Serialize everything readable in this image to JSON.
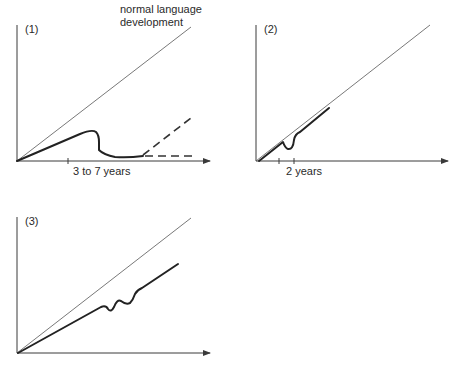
{
  "figure": {
    "panels": [
      {
        "id": "1",
        "label": "(1)",
        "annotation": [
          "normal language",
          "development"
        ],
        "x_label": "3 to 7 years",
        "series": [
          {
            "name": "normal language development",
            "style": "thin-line"
          },
          {
            "name": "development with regression",
            "style": "thick-line"
          },
          {
            "name": "possible recovery",
            "style": "dashed"
          },
          {
            "name": "possible plateau",
            "style": "dashed"
          }
        ]
      },
      {
        "id": "2",
        "label": "(2)",
        "x_label": "2 years",
        "series": [
          {
            "name": "normal language development",
            "style": "thin-line"
          },
          {
            "name": "development with brief dip",
            "style": "thick-line"
          }
        ]
      },
      {
        "id": "3",
        "label": "(3)",
        "x_label": "",
        "series": [
          {
            "name": "normal language development",
            "style": "thin-line"
          },
          {
            "name": "slower development with fluctuations",
            "style": "thick-line"
          }
        ]
      }
    ],
    "colors": {
      "line": "#222222",
      "axis": "#3a3a3a",
      "background": "#ffffff"
    }
  }
}
